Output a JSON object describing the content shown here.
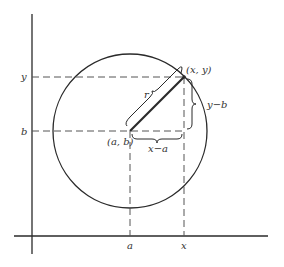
{
  "diagram": {
    "labels": {
      "point": "(x, y)",
      "center": "(a, b)",
      "radius": "r",
      "vertical_leg": "y−b",
      "horizontal_leg": "x−a",
      "y_tick": "y",
      "b_tick": "b",
      "a_tick": "a",
      "x_tick": "x"
    },
    "colors": {
      "stroke": "#2a2a2a",
      "dash": "#555555",
      "background": "#ffffff"
    }
  }
}
